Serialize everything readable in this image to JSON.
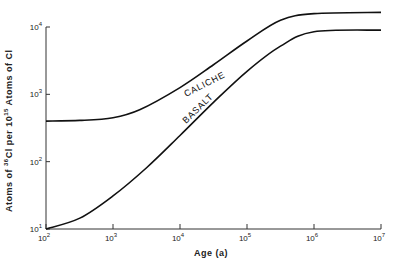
{
  "chart_data": {
    "type": "line",
    "title": "",
    "xlabel": "Age (a)",
    "ylabel": "Atoms of 36Cl per 10^15 Atoms of Cl",
    "x_scale": "log",
    "y_scale": "log",
    "xlim": [
      100,
      10000000
    ],
    "ylim": [
      10,
      10000
    ],
    "grid": false,
    "legend": "inline labels on curves",
    "x_ticks": [
      "10^2",
      "10^3",
      "10^4",
      "10^5",
      "10^6",
      "10^7"
    ],
    "y_ticks": [
      "10^1",
      "10^2",
      "10^3",
      "10^4"
    ],
    "series": [
      {
        "name": "CALICHE",
        "x": [
          100,
          320,
          1000,
          2500,
          10000,
          31600,
          100000,
          316000,
          1000000,
          10000000
        ],
        "y": [
          400,
          410,
          450,
          590,
          1260,
          2750,
          6200,
          12600,
          15800,
          16500
        ]
      },
      {
        "name": "BASALT",
        "x": [
          100,
          320,
          1000,
          3200,
          10000,
          31600,
          100000,
          316000,
          1000000,
          10000000
        ],
        "y": [
          10,
          14.5,
          31,
          82,
          245,
          760,
          2200,
          5200,
          8500,
          9000
        ]
      }
    ]
  },
  "labels": {
    "xlabel": "Age (a)",
    "ylabel_parts": [
      "Atoms of ",
      "36",
      "Cl per 10",
      "15",
      " Atoms of Cl"
    ],
    "caliche": "CALICHE",
    "basalt": "BASALT",
    "y_tick_base": "10",
    "x_tick_base": "10"
  }
}
